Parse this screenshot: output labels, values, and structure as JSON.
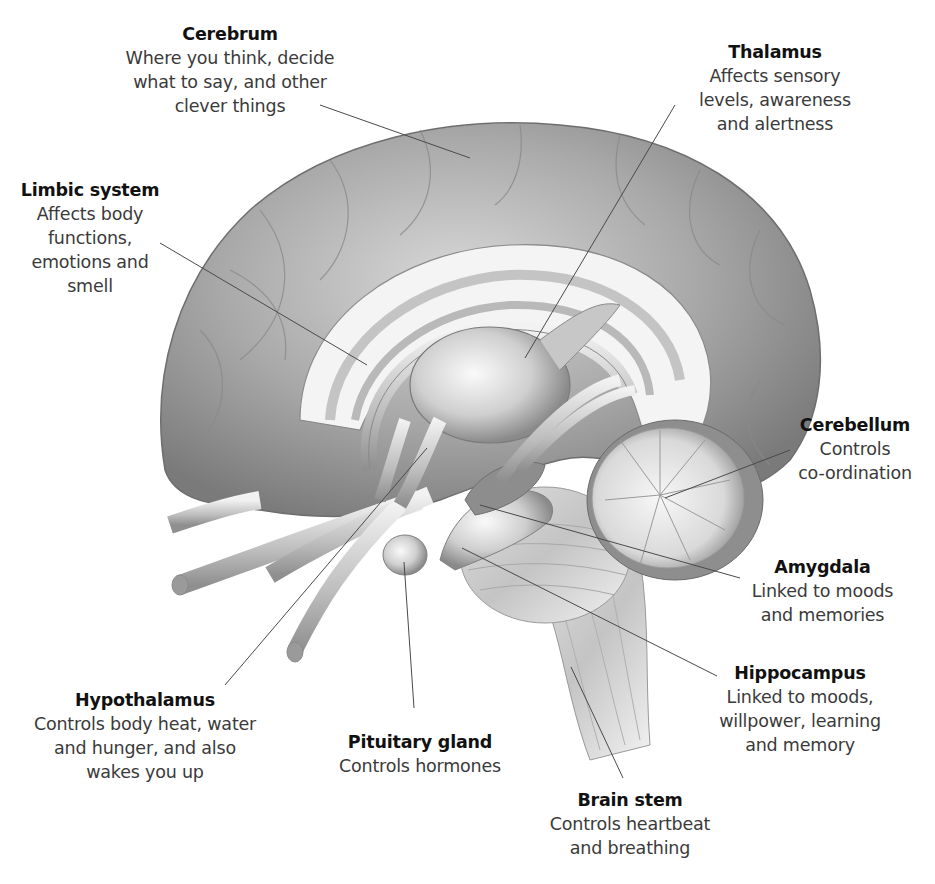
{
  "diagram": {
    "labels": {
      "cerebrum": {
        "title": "Cerebrum",
        "description": "Where you think, decide\nwhat to say, and other\nclever things"
      },
      "thalamus": {
        "title": "Thalamus",
        "description": "Affects sensory\nlevels, awareness\nand alertness"
      },
      "limbic_system": {
        "title": "Limbic system",
        "description": "Affects body\nfunctions,\nemotions and\nsmell"
      },
      "cerebellum": {
        "title": "Cerebellum",
        "description": "Controls\nco-ordination"
      },
      "amygdala": {
        "title": "Amygdala",
        "description": "Linked to moods\nand memories"
      },
      "hippocampus": {
        "title": "Hippocampus",
        "description": "Linked to moods,\nwillpower, learning\nand memory"
      },
      "hypothalamus": {
        "title": "Hypothalamus",
        "description": "Controls body heat, water\nand hunger, and also\nwakes you up"
      },
      "pituitary_gland": {
        "title": "Pituitary gland",
        "description": "Controls hormones"
      },
      "brain_stem": {
        "title": "Brain stem",
        "description": "Controls heartbeat\nand breathing"
      }
    },
    "colors": {
      "background": "#ffffff",
      "title_text": "#111111",
      "description_text": "#3a3a3a",
      "leader_line": "#4a4a4a",
      "brain_dark": "#6e6e6e",
      "brain_mid": "#a8a8a8",
      "brain_light": "#e6e6e6"
    }
  }
}
